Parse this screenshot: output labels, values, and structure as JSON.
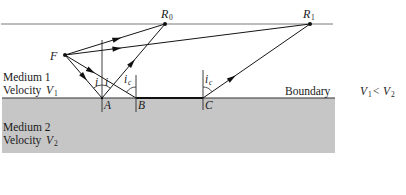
{
  "diagram": {
    "colors": {
      "medium2_fill": "#c6c6c6",
      "surface_line": "#7a7a7a",
      "ink": "#151515"
    },
    "points": {
      "source": "F",
      "receiver_0": {
        "letter": "R",
        "sub": "0"
      },
      "receiver_1": {
        "letter": "R",
        "sub": "1"
      },
      "A": "A",
      "B": "B",
      "C": "C"
    },
    "angles": {
      "incidence": "i",
      "reflection": "i",
      "critical_B": {
        "letter": "i",
        "sub": "c"
      },
      "critical_C": {
        "letter": "i",
        "sub": "c"
      }
    },
    "media": {
      "medium1": {
        "name": "Medium 1",
        "velocity_word": "Velocity",
        "velocity_var": "V",
        "velocity_sub": "1"
      },
      "medium2": {
        "name": "Medium 2",
        "velocity_word": "Velocity",
        "velocity_var": "V",
        "velocity_sub": "2"
      }
    },
    "boundary_label": "Boundary",
    "condition": {
      "left_var": "V",
      "left_sub": "1",
      "operator": "<",
      "right_var": "V",
      "right_sub": "2"
    },
    "rays": [
      "F → R0 (direct)",
      "F → R1 (direct)",
      "F → A → R0 (reflected)",
      "F → B (critical incidence) → C (along boundary) → R1 (refracted head wave)"
    ]
  }
}
